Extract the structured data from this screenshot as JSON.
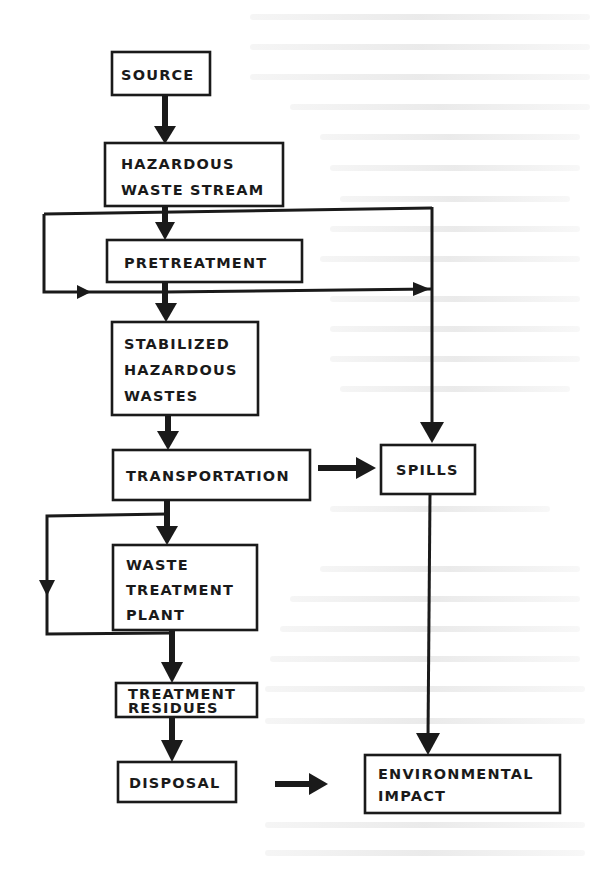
{
  "diagram": {
    "type": "flowchart",
    "nodes": {
      "source": {
        "lines": [
          "SOURCE"
        ]
      },
      "hazardous_waste_stream": {
        "lines": [
          "HAZARDOUS",
          "WASTE STREAM"
        ]
      },
      "pretreatment": {
        "lines": [
          "PRETREATMENT"
        ]
      },
      "stabilized_hazardous_wastes": {
        "lines": [
          "STABILIZED",
          "HAZARDOUS",
          "WASTES"
        ]
      },
      "transportation": {
        "lines": [
          "TRANSPORTATION"
        ]
      },
      "spills": {
        "lines": [
          "SPILLS"
        ]
      },
      "waste_treatment_plant": {
        "lines": [
          "WASTE",
          "TREATMENT",
          "PLANT"
        ]
      },
      "treatment_residues": {
        "lines": [
          "TREATMENT",
          "RESIDUES"
        ]
      },
      "disposal": {
        "lines": [
          "DISPOSAL"
        ]
      },
      "environmental_impact": {
        "lines": [
          "ENVIRONMENTAL",
          "IMPACT"
        ]
      }
    },
    "edges": [
      {
        "from": "SOURCE",
        "to": "HAZARDOUS WASTE STREAM"
      },
      {
        "from": "HAZARDOUS WASTE STREAM",
        "to": "PRETREATMENT"
      },
      {
        "from": "HAZARDOUS WASTE STREAM",
        "to": "STABILIZED HAZARDOUS WASTES",
        "note": "bypass loop around pretreatment"
      },
      {
        "from": "HAZARDOUS WASTE STREAM",
        "to": "SPILLS"
      },
      {
        "from": "PRETREATMENT",
        "to": "STABILIZED HAZARDOUS WASTES"
      },
      {
        "from": "PRETREATMENT",
        "to": "SPILLS"
      },
      {
        "from": "STABILIZED HAZARDOUS WASTES",
        "to": "TRANSPORTATION"
      },
      {
        "from": "TRANSPORTATION",
        "to": "SPILLS"
      },
      {
        "from": "TRANSPORTATION",
        "to": "WASTE TREATMENT PLANT"
      },
      {
        "from": "TRANSPORTATION",
        "to": "TREATMENT RESIDUES",
        "note": "bypass loop around waste treatment plant"
      },
      {
        "from": "WASTE TREATMENT PLANT",
        "to": "TREATMENT RESIDUES"
      },
      {
        "from": "TREATMENT RESIDUES",
        "to": "DISPOSAL"
      },
      {
        "from": "DISPOSAL",
        "to": "ENVIRONMENTAL IMPACT"
      },
      {
        "from": "SPILLS",
        "to": "ENVIRONMENTAL IMPACT"
      }
    ],
    "colors": {
      "ink": "#1a1a1a",
      "paper": "#ffffff"
    }
  }
}
